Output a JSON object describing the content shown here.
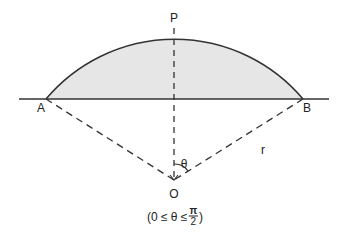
{
  "diagram": {
    "type": "circular-segment",
    "colors": {
      "stroke": "#333333",
      "fill": "#e6e6e6",
      "text": "#222222"
    },
    "points": {
      "A": {
        "label": "A",
        "x": 46,
        "y": 99
      },
      "B": {
        "label": "B",
        "x": 303,
        "y": 99
      },
      "P": {
        "label": "P",
        "x": 174,
        "y": 28
      },
      "O": {
        "label": "O",
        "x": 174,
        "y": 180
      }
    },
    "labels": {
      "A": "A",
      "B": "B",
      "P": "P",
      "O": "O",
      "theta": "θ",
      "radius": "r"
    },
    "caption": {
      "open": "(0 ≤ θ ≤",
      "frac_num": "π",
      "frac_den": "2",
      "close": ")"
    }
  }
}
